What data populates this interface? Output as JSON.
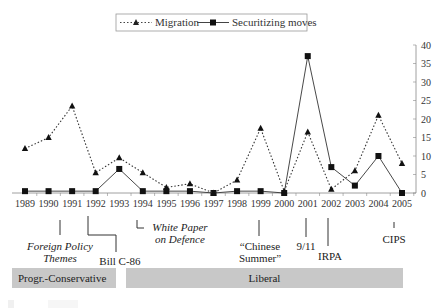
{
  "chart_data": {
    "type": "line",
    "title": "",
    "xlabel": "",
    "ylabel": "",
    "ylim": [
      0,
      40
    ],
    "yticks": [
      0,
      5,
      10,
      15,
      20,
      25,
      30,
      35,
      40
    ],
    "y_axis_position": "right",
    "legend_position": "top",
    "grid": false,
    "categories": [
      "1989",
      "1990",
      "1991",
      "1992",
      "1993",
      "1994",
      "1995",
      "1996",
      "1997",
      "1998",
      "1999",
      "2000",
      "2001",
      "2002",
      "2003",
      "2004",
      "2005"
    ],
    "series": [
      {
        "name": "Migration",
        "style": "dotted",
        "marker": "triangle",
        "values": [
          12,
          15,
          23.5,
          5.5,
          9.5,
          5.5,
          1.5,
          2.5,
          0,
          3.5,
          17.5,
          0.5,
          16.5,
          1,
          6,
          21,
          8
        ]
      },
      {
        "name": "Securitizing moves",
        "style": "solid",
        "marker": "square",
        "values": [
          0.5,
          0.5,
          0.5,
          0.5,
          6.5,
          0.5,
          0.5,
          0.5,
          0,
          0.5,
          0.5,
          0,
          37,
          7,
          2,
          10,
          0
        ]
      }
    ],
    "annotations": [
      {
        "year": "1991",
        "label": "Foreign Policy Themes"
      },
      {
        "year": "1992",
        "label": "Bill C-86"
      },
      {
        "year": "1994",
        "label": "White Paper on Defence"
      },
      {
        "year": "1999",
        "label": "“Chinese Summer”"
      },
      {
        "year": "2001",
        "label": "9/11"
      },
      {
        "year": "2002",
        "label": "IRPA"
      },
      {
        "year": "2005",
        "label": "CIPS"
      }
    ],
    "periods": [
      {
        "label": "Progr.-Conservative",
        "from": "1989",
        "to": "1993"
      },
      {
        "label": "Liberal",
        "from": "1993",
        "to": "2005"
      }
    ]
  },
  "legend": {
    "migration": "Migration",
    "securitizing": "Securitizing moves"
  },
  "annotations": {
    "foreign_policy_line1": "Foreign Policy",
    "foreign_policy_line2": "Themes",
    "bill": "Bill C-86",
    "white_paper_line1": "White Paper",
    "white_paper_line2": "on Defence",
    "chinese_line1": "“Chinese",
    "chinese_line2": "Summer”",
    "nine_eleven": "9/11",
    "irpa": "IRPA",
    "cips": "CIPS"
  },
  "periods": {
    "conservative": "Progr.-Conservative",
    "liberal": "Liberal"
  }
}
